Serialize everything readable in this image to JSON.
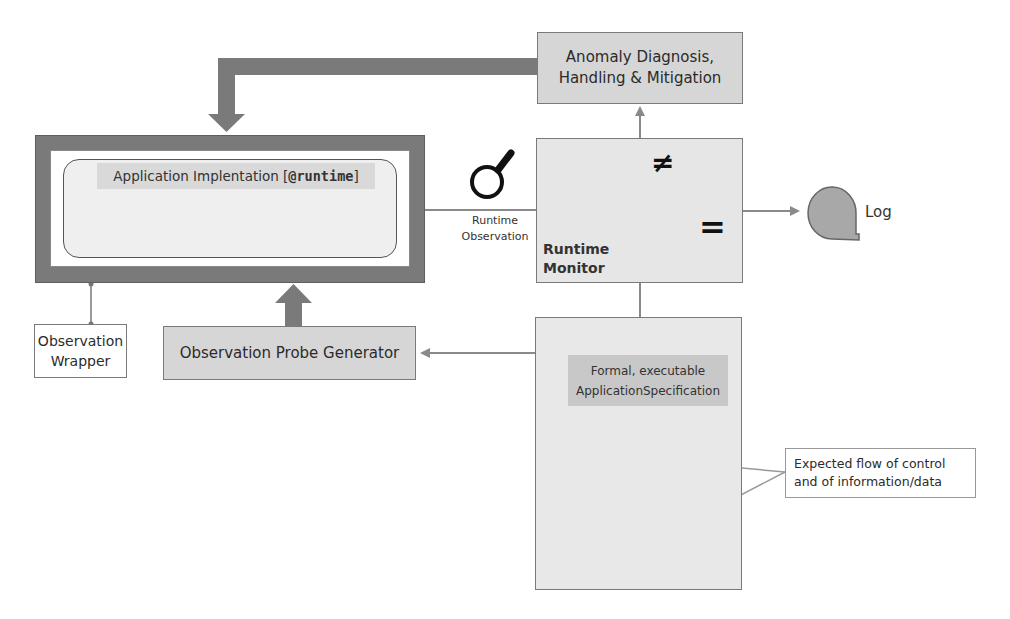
{
  "diagram": {
    "nodes": {
      "anomaly": {
        "line1": "Anomaly Diagnosis,",
        "line2": "Handling & Mitigation"
      },
      "runtime_monitor": {
        "line1": "Runtime",
        "line2": "Monitor",
        "neq_symbol": "≠",
        "eq_symbol": "="
      },
      "application": {
        "title_prefix": "Application Implentation [",
        "title_code": "@runtime",
        "title_suffix": "]",
        "flow_groups": 4
      },
      "observation_wrapper": {
        "line1": "Observation",
        "line2": "Wrapper"
      },
      "probe_generator": {
        "label": "Observation Probe Generator"
      },
      "runtime_observation": {
        "line1": "Runtime",
        "line2": "Observation"
      },
      "specification": {
        "line1": "Formal, executable",
        "line2": "ApplicationSpecification"
      },
      "expected_flow": {
        "line1": "Expected flow of control",
        "line2": "and of information/data"
      },
      "log": {
        "label": "Log"
      }
    },
    "icons": [
      "magnifier-icon",
      "log-storage-icon",
      "decision-diamond-icon",
      "flowchart-icon"
    ],
    "colors": {
      "dark_frame": "#7a7a7a",
      "box_fill": "#d6d6d6",
      "monitor_fill": "#e6e6e6",
      "shape_fill": "#a8a8a8",
      "line": "#808080",
      "flowchart": "#111111"
    }
  }
}
